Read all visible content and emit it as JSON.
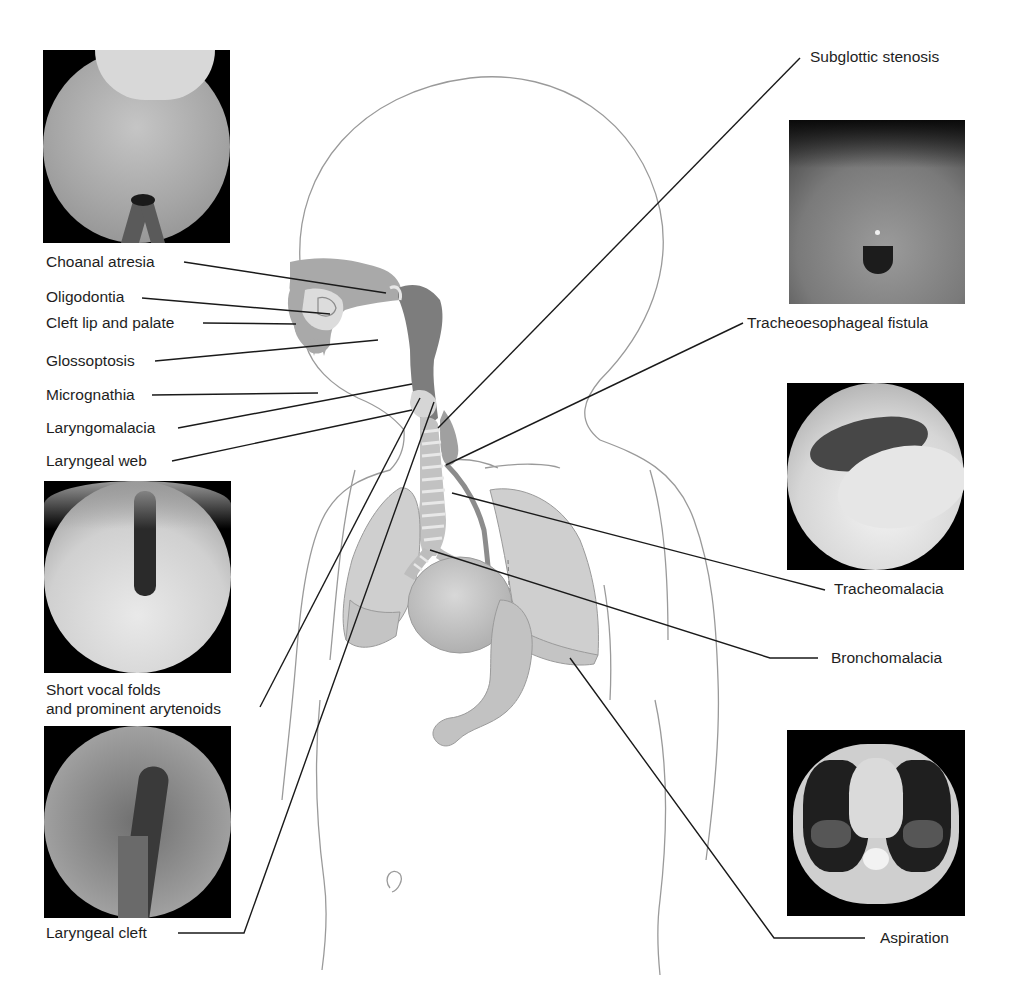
{
  "figure": {
    "labels": {
      "choanal_atresia": "Choanal atresia",
      "oligodontia": "Oligodontia",
      "cleft_lip_palate": "Cleft lip and palate",
      "glossoptosis": "Glossoptosis",
      "micrognathia": "Micrognathia",
      "laryngomalacia": "Laryngomalacia",
      "laryngeal_web": "Laryngeal web",
      "short_vocal_folds_line1": "Short vocal folds",
      "short_vocal_folds_line2": "and prominent arytenoids",
      "laryngeal_cleft": "Laryngeal cleft",
      "subglottic_stenosis": "Subglottic stenosis",
      "tracheoesophageal_fistula": "Tracheoesophageal fistula",
      "tracheomalacia": "Tracheomalacia",
      "bronchomalacia": "Bronchomalacia",
      "aspiration": "Aspiration"
    },
    "photos": [
      {
        "id": "choanal-atresia-endoscopy",
        "kind": "endoscopic"
      },
      {
        "id": "laryngeal-web-endoscopy",
        "kind": "endoscopic"
      },
      {
        "id": "laryngeal-cleft-endoscopy",
        "kind": "endoscopic"
      },
      {
        "id": "tracheoesophageal-fistula-endoscopy",
        "kind": "endoscopic"
      },
      {
        "id": "tracheomalacia-endoscopy",
        "kind": "endoscopic"
      },
      {
        "id": "aspiration-ct-scan",
        "kind": "ct"
      }
    ],
    "colors": {
      "outline": "#9a9a9a",
      "leader": "#1a1a1a",
      "organ_light": "#cfcfcf",
      "organ_mid": "#a9a9a9",
      "organ_dark": "#7d7d7d",
      "text": "#1e1e1e"
    }
  }
}
